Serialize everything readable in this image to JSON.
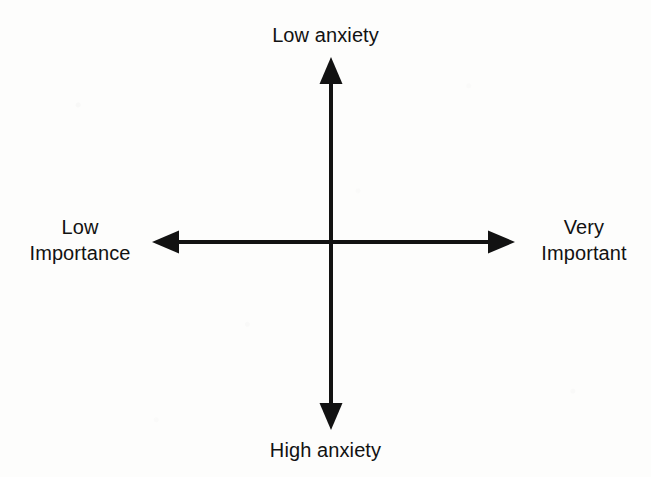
{
  "diagram": {
    "type": "quadrant-axes",
    "title": "",
    "background_color": "#fdfdfc",
    "line_color": "#121212",
    "axes": {
      "vertical": {
        "top_label": "Low anxiety",
        "bottom_label": "High anxiety"
      },
      "horizontal": {
        "left_label": "Low\nImportance",
        "right_label": "Very\nImportant"
      }
    },
    "labels": {
      "top": "Low anxiety",
      "bottom": "High anxiety",
      "left": "Low\nImportance",
      "right": "Very\nImportant"
    },
    "geometry": {
      "center_x": 331,
      "center_y": 242,
      "vertical_top_y": 57,
      "vertical_bottom_y": 430,
      "horizontal_left_x": 152,
      "horizontal_right_x": 515,
      "shaft_width": 4,
      "arrowhead_length": 27,
      "arrowhead_width": 23
    }
  }
}
